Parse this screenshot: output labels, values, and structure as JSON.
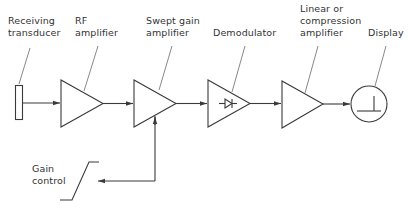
{
  "diagram": {
    "labels": {
      "receiving_transducer": [
        "Receiving",
        "transducer"
      ],
      "rf_amplifier": [
        "RF",
        "amplifier"
      ],
      "swept_gain_amplifier": [
        "Swept gain",
        "amplifier"
      ],
      "demodulator": [
        "Demodulator"
      ],
      "linear_compression_amplifier": [
        "Linear or",
        "compression",
        "amplifier"
      ],
      "display": [
        "Display"
      ],
      "gain_control": [
        "Gain",
        "control"
      ]
    },
    "blocks": [
      {
        "id": "receiving-transducer",
        "shape": "rectangle"
      },
      {
        "id": "rf-amplifier",
        "shape": "triangle"
      },
      {
        "id": "swept-gain-amplifier",
        "shape": "triangle"
      },
      {
        "id": "demodulator",
        "shape": "triangle",
        "symbol": "diode"
      },
      {
        "id": "linear-compression-amplifier",
        "shape": "triangle"
      },
      {
        "id": "display",
        "shape": "circle",
        "symbol": "trace"
      }
    ],
    "connections": [
      [
        "receiving-transducer",
        "rf-amplifier"
      ],
      [
        "rf-amplifier",
        "swept-gain-amplifier"
      ],
      [
        "swept-gain-amplifier",
        "demodulator"
      ],
      [
        "demodulator",
        "linear-compression-amplifier"
      ],
      [
        "linear-compression-amplifier",
        "display"
      ],
      [
        "gain-control",
        "swept-gain-amplifier"
      ]
    ],
    "colors": {
      "line": "#3a3a3a",
      "text": "#333333",
      "background": "#ffffff"
    }
  }
}
